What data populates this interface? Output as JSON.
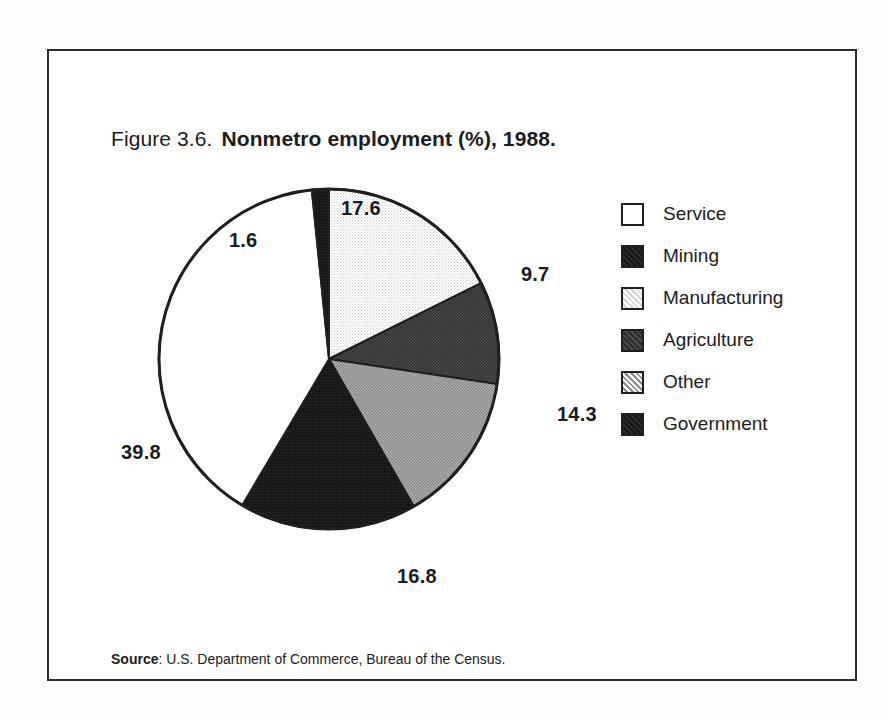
{
  "figure": {
    "number": "Figure 3.6.",
    "caption": "Nonmetro employment (%), 1988."
  },
  "source": {
    "label": "Source",
    "separator": ":",
    "text": "U.S. Department of Commerce, Bureau of the Census."
  },
  "legend": {
    "items": [
      {
        "label": "Service",
        "color": "#ffffff",
        "swatch": "legend-swatch-service"
      },
      {
        "label": "Mining",
        "color": "#1b1b1b",
        "swatch": "legend-swatch-mining"
      },
      {
        "label": "Manufacturing",
        "color": "#e3e3e3",
        "swatch": "legend-swatch-manufacturing"
      },
      {
        "label": "Agriculture",
        "color": "#3a3a3a",
        "swatch": "legend-swatch-agriculture"
      },
      {
        "label": "Other",
        "color": "#9c9c9c",
        "swatch": "legend-swatch-other"
      },
      {
        "label": "Government",
        "color": "#1b1b1b",
        "swatch": "legend-swatch-government"
      }
    ]
  },
  "labels": {
    "manufacturing": "17.6",
    "agriculture": "9.7",
    "other": "14.3",
    "government": "16.8",
    "service": "39.8",
    "mining": "1.6"
  },
  "chart_data": {
    "type": "pie",
    "title": "Nonmetro employment (%), 1988.",
    "subtitle": "",
    "xlabel": "",
    "ylabel": "",
    "units": "percent",
    "total": 99.8,
    "start_angle_deg": 0,
    "direction": "clockwise",
    "legend_position": "right",
    "grid": false,
    "categories": [
      "Manufacturing",
      "Agriculture",
      "Other",
      "Government",
      "Service",
      "Mining"
    ],
    "values": [
      17.6,
      9.7,
      14.3,
      16.8,
      39.8,
      1.6
    ],
    "slices": [
      {
        "name": "Manufacturing",
        "value": 17.6,
        "label": "17.6",
        "color": "#e3e3e3",
        "start_deg": 0.0,
        "end_deg": 63.5
      },
      {
        "name": "Agriculture",
        "value": 9.7,
        "label": "9.7",
        "color": "#3a3a3a",
        "start_deg": 63.5,
        "end_deg": 98.5
      },
      {
        "name": "Other",
        "value": 14.3,
        "label": "14.3",
        "color": "#9c9c9c",
        "start_deg": 98.5,
        "end_deg": 150.1
      },
      {
        "name": "Government",
        "value": 16.8,
        "label": "16.8",
        "color": "#1b1b1b",
        "start_deg": 150.1,
        "end_deg": 210.7
      },
      {
        "name": "Service",
        "value": 39.8,
        "label": "39.8",
        "color": "#ffffff",
        "start_deg": 210.7,
        "end_deg": 354.2
      },
      {
        "name": "Mining",
        "value": 1.6,
        "label": "1.6",
        "color": "#1b1b1b",
        "start_deg": 354.2,
        "end_deg": 360.0
      }
    ],
    "annotations": [
      "Source: U.S. Department of Commerce, Bureau of the Census."
    ]
  }
}
